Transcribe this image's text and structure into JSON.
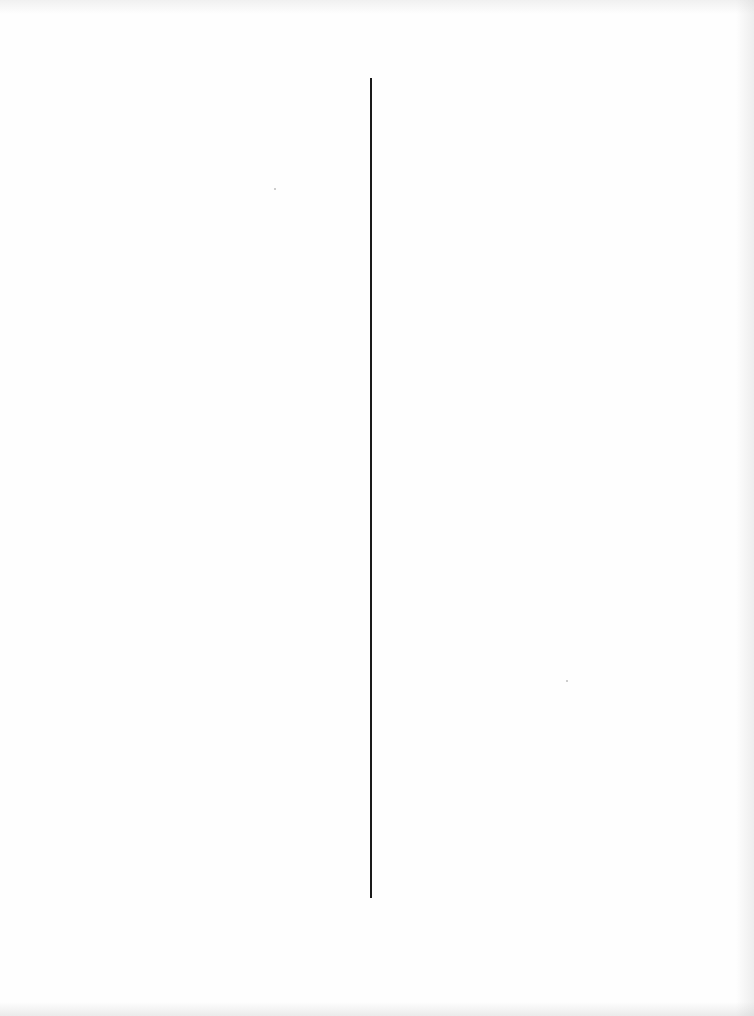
{
  "document": {
    "type": "scanned-blank-page",
    "divider": {
      "orientation": "vertical",
      "x": 370,
      "y_start": 78,
      "y_end": 898,
      "color": "#1a1a1a"
    },
    "background_color": "#fefefe",
    "text": []
  }
}
